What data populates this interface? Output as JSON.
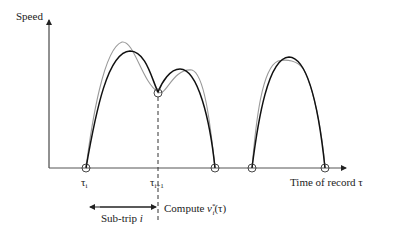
{
  "axes": {
    "y_label": "Speed",
    "x_label": "Time of record τ"
  },
  "ticks": {
    "tau_i": "τ",
    "tau_i_sub": "i",
    "tau_i1": "τ",
    "tau_i1_sub": "i+1"
  },
  "annotations": {
    "subtrip": "Sub-trip ",
    "subtrip_italic": "i",
    "compute": "Compute ",
    "compute_v": "v",
    "compute_sub": "i",
    "compute_sup": "*",
    "compute_arg": "(τ)"
  },
  "colors": {
    "estimate": "#111111",
    "observed": "#999999"
  }
}
